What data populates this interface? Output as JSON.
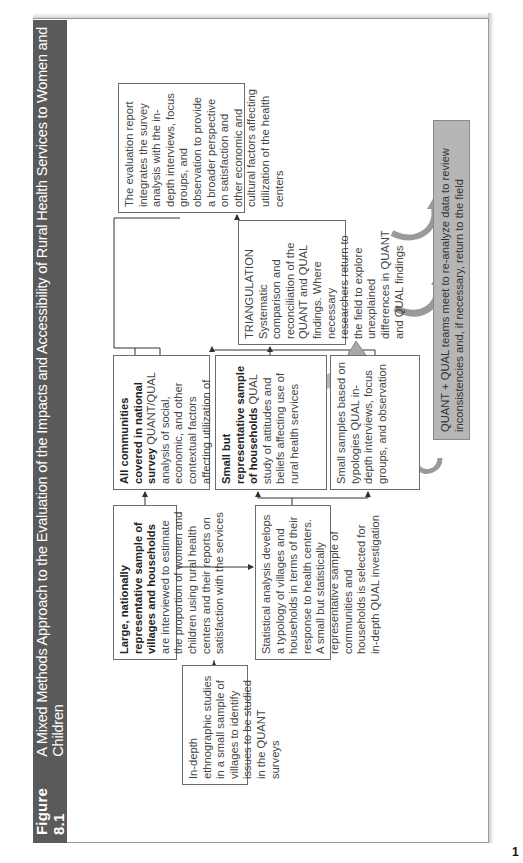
{
  "figure": {
    "number": "Figure 8.1",
    "title": "A Mixed Methods Approach to the Evaluation of the Impacts and Accessibility of Rural Health Services to Women and Children"
  },
  "boxes": {
    "ethnographic": {
      "text": "In-depth ethnographic studies in a small sample of villages to identify issues to be studied in the QUANT surveys"
    },
    "large_sample": {
      "bold": "Large, nationally representative sample of villages and households",
      "text": "are interviewed to estimate the proportion of women and children using rural health centers and their reports on satisfaction with the services"
    },
    "statistical": {
      "text": "Statistical analysis develops a typology of villages and households in terms of their response to health centers. A small but statistically representative sample of communities and households is selected for in-depth QUAL investigation"
    },
    "all_communities": {
      "bold": "All communities covered in national survey",
      "text": "QUANT/QUAL analysis of social, economic, and other contextual factors affecting utilization of services"
    },
    "small_representative": {
      "bold": "Small but representative sample of households",
      "text": "QUAL study of attitudes and beliefs affecting use of rural health services"
    },
    "small_samples": {
      "text": "Small samples based on typologies QUAL in-depth interviews, focus groups, and observation"
    },
    "triangulation": {
      "heading": "TRIANGULATION",
      "text": "Systematic comparison and reconciliation of the QUANT and QUAL findings. Where necessary researchers return to the field to explore unexplained differences in QUANT and QUAL findings"
    },
    "evaluation_report": {
      "text": "The evaluation report integrates the survey analysis with the in-depth interviews, focus groups, and observation to provide a broader perspective on satisfaction and other economic and cultural factors affecting utilization of the health centers"
    },
    "review": {
      "text": "QUANT + QUAL teams meet to re-analyze data to review inconsistencies and, if necessary, return to the field"
    }
  },
  "colors": {
    "title_bar": "#5a5a5a",
    "review_box": "#b6b6b6",
    "border": "#6d6d6d",
    "arrow_fill": "#b0b0b0"
  },
  "page_number": "1"
}
